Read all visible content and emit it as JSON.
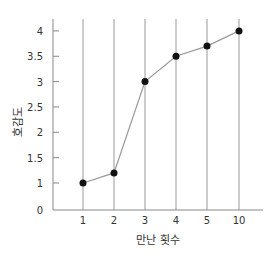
{
  "chart_data": {
    "type": "line",
    "title": "",
    "xlabel": "만난 횟수",
    "ylabel": "호감도",
    "categories": [
      "1",
      "2",
      "3",
      "4",
      "5",
      "10"
    ],
    "values": [
      1,
      1.2,
      3,
      3.5,
      3.7,
      4
    ],
    "yticks": [
      0,
      1,
      1.5,
      2,
      2.5,
      3,
      3.5,
      4
    ],
    "ytick_labels": [
      "0",
      "1",
      "1.5",
      "2",
      "2.5",
      "3",
      "3.5",
      "4"
    ],
    "ylim": [
      0,
      4
    ],
    "grid": "vertical lines at each category",
    "legend": null,
    "colors": {
      "line": "#999999",
      "marker": "#111111",
      "axis": "#888888",
      "text": "#333333"
    }
  }
}
